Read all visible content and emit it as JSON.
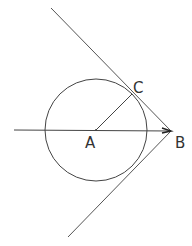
{
  "diagram": {
    "type": "geometry",
    "points": {
      "A": {
        "label": "A",
        "x": 96,
        "y": 130
      },
      "B": {
        "label": "B",
        "x": 171,
        "y": 131
      },
      "C": {
        "label": "C",
        "x": 132,
        "y": 94
      }
    },
    "circle": {
      "center": "A",
      "radius": 51
    },
    "segments": [
      {
        "name": "horizontal-axis",
        "from": [
          14,
          130
        ],
        "to": [
          171,
          131
        ]
      },
      {
        "name": "radius-AC",
        "from": "A",
        "to": "C"
      },
      {
        "name": "upper-tangent",
        "from": [
          51,
          8
        ],
        "to": "B"
      },
      {
        "name": "lower-tangent",
        "from": "B",
        "to": [
          68,
          237
        ]
      }
    ],
    "arrow_at": "B",
    "colors": {
      "stroke": "#444444",
      "background": "#ffffff"
    }
  }
}
